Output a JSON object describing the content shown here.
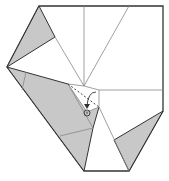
{
  "diagram": {
    "type": "origami-fold-step",
    "colors": {
      "paper_front": "#ffffff",
      "paper_back": "#c8c8c8",
      "edge": "#333333",
      "crease": "#888888",
      "fold_line": "#333333"
    },
    "symbols": {
      "fold_arrow": "arrow-down-icon",
      "target_point": "circled-dot-icon",
      "valley_fold": "dashed-line"
    }
  }
}
